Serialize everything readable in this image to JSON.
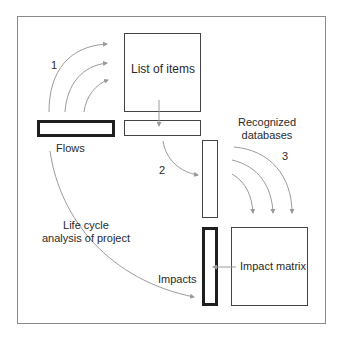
{
  "diagram": {
    "nodes": {
      "list_of_items": {
        "label": "List of items"
      },
      "flows": {
        "label": "Flows"
      },
      "recognized_databases": {
        "line1": "Recognized",
        "line2": "databases"
      },
      "impacts": {
        "label": "Impacts"
      },
      "impact_matrix": {
        "label": "Impact matrix"
      },
      "lca": {
        "line1": "Life cycle",
        "line2": "analysis of project"
      }
    },
    "steps": {
      "one": "1",
      "two": "2",
      "three": "3"
    },
    "colors": {
      "frame": "#8a8a8a",
      "arrow": "#9a9a9a",
      "box_thin": "#444444",
      "box_thick": "#1e1e1e"
    }
  }
}
